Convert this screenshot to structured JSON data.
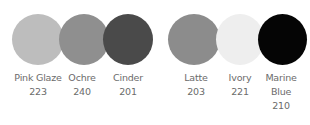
{
  "swatches": [
    {
      "name": "Pink Glaze",
      "code": "223",
      "color": "#bdbdbd"
    },
    {
      "name": "Ochre",
      "code": "240",
      "color": "#8f8f8f"
    },
    {
      "name": "Cinder",
      "code": "201",
      "color": "#4a4a4a"
    },
    {
      "name": "Latte",
      "code": "203",
      "color": "#8c8c8c"
    },
    {
      "name": "Ivory",
      "code": "221",
      "color": "#eeeeee"
    },
    {
      "name": "Marine Blue",
      "name_line1": "Marine",
      "name_line2": "Blue",
      "code": "210",
      "color": "#050505"
    }
  ]
}
